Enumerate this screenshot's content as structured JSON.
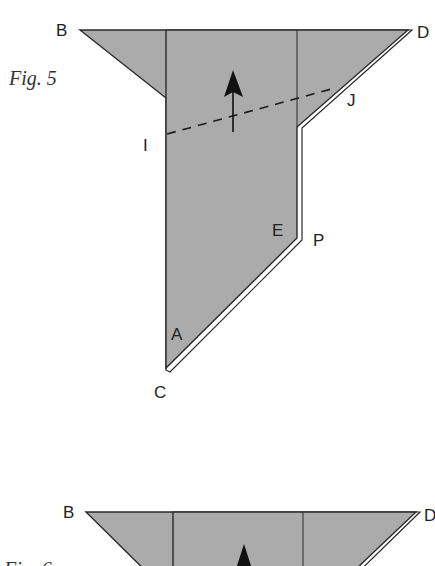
{
  "figures": [
    {
      "caption": "Fig. 5",
      "points": {
        "B": "B",
        "D": "D",
        "I": "I",
        "J": "J",
        "E": "E",
        "P": "P",
        "A": "A",
        "C": "C"
      },
      "arrow": "up-arrow",
      "fold_line": "dashed-fold-line-I-J"
    },
    {
      "caption": "Fig. 6",
      "points": {
        "B": "B",
        "D": "D"
      },
      "arrow": "up-arrow"
    }
  ],
  "colors": {
    "paper_fill": "#ababab",
    "stroke": "#2a2a2a",
    "background": "#ffffff"
  }
}
